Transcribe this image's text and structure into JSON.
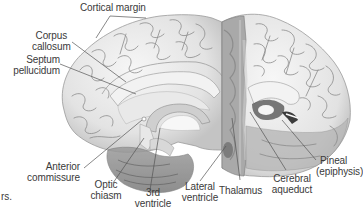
{
  "figure": {
    "type": "anatomical-illustration",
    "colors": {
      "cortex": "#ececec",
      "cortex_shadow": "#bdbdbd",
      "sulcus": "#8a8a8a",
      "cut_surface": "#a9a9a9",
      "white_matter": "#f4f4f4",
      "label_text": "#3a3a3a",
      "leader_line": "#555555"
    }
  },
  "labels": {
    "cortical_margin": "Cortical margin",
    "corpus_callosum": [
      "Corpus",
      "callosum"
    ],
    "septum_pellucidum": [
      "Septum",
      "pellucidum"
    ],
    "anterior_commissure": [
      "Anterior",
      "commissure"
    ],
    "optic_chiasm": [
      "Optic",
      "chiasm"
    ],
    "third_ventricle": [
      "3rd",
      "ventricle"
    ],
    "lateral_ventricle": [
      "Lateral",
      "ventricle"
    ],
    "thalamus": "Thalamus",
    "cerebral_aqueduct": [
      "Cerebral",
      "aqueduct"
    ],
    "pineal": [
      "Pineal",
      "(epiphysis)"
    ]
  },
  "fragments": {
    "left_edge_text": "rs."
  }
}
